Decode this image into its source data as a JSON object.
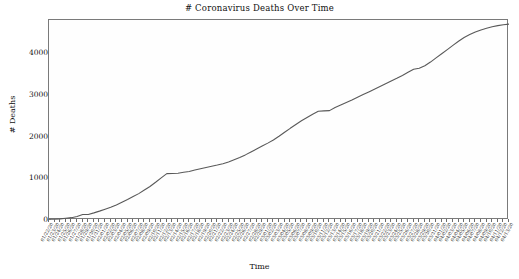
{
  "chart_data": {
    "type": "line",
    "title": "# Coronavirus Deaths Over Time",
    "xlabel": "Time",
    "ylabel": "# Deaths",
    "ylim": [
      0,
      4800
    ],
    "yticks": [
      0,
      1000,
      2000,
      3000,
      4000
    ],
    "ytick_labels": [
      "0",
      "1000",
      "2000",
      "3000",
      "4000"
    ],
    "grid": false,
    "legend": null,
    "line_color": "#595959",
    "frame_color": "#7a7a7a",
    "background": "#fefefe",
    "x": [
      "01/22/20",
      "01/23/20",
      "01/24/20",
      "01/25/20",
      "01/26/20",
      "01/27/20",
      "01/28/20",
      "01/29/20",
      "01/30/20",
      "01/31/20",
      "02/01/20",
      "02/02/20",
      "02/03/20",
      "02/04/20",
      "02/05/20",
      "02/06/20",
      "02/07/20",
      "02/08/20",
      "02/09/20",
      "02/10/20",
      "02/11/20",
      "02/12/20",
      "02/13/20",
      "02/14/20",
      "02/15/20",
      "02/16/20",
      "02/17/20",
      "02/18/20",
      "02/19/20",
      "02/20/20",
      "02/21/20",
      "02/22/20",
      "02/23/20",
      "02/24/20",
      "02/25/20",
      "02/26/20",
      "02/27/20",
      "02/28/20",
      "02/29/20",
      "03/01/20",
      "03/02/20",
      "03/03/20",
      "03/04/20",
      "03/05/20",
      "03/06/20",
      "03/07/20",
      "03/08/20",
      "03/09/20",
      "03/10/20",
      "03/11/20",
      "03/12/20",
      "03/13/20",
      "03/14/20",
      "03/15/20",
      "03/16/20",
      "03/17/20",
      "03/18/20",
      "03/19/20",
      "03/20/20",
      "03/21/20",
      "03/22/20",
      "03/23/20",
      "03/24/20",
      "03/25/20",
      "03/26/20",
      "03/27/20",
      "03/28/20",
      "03/29/20",
      "03/30/20",
      "03/31/20",
      "04/01/20",
      "04/02/20",
      "04/03/20",
      "04/04/20",
      "04/05/20",
      "04/06/20",
      "04/07/20",
      "04/08/20",
      "04/09/20",
      "04/10/20",
      "04/11/20",
      "04/12/20",
      "04/13/20"
    ],
    "values": [
      17,
      18,
      26,
      42,
      56,
      82,
      131,
      133,
      171,
      213,
      259,
      304,
      361,
      425,
      491,
      563,
      633,
      718,
      805,
      905,
      1012,
      1112,
      1117,
      1123,
      1145,
      1164,
      1198,
      1230,
      1261,
      1290,
      1318,
      1350,
      1390,
      1444,
      1500,
      1563,
      1632,
      1702,
      1774,
      1845,
      1920,
      2010,
      2105,
      2200,
      2290,
      2380,
      2460,
      2540,
      2610,
      2620,
      2625,
      2700,
      2760,
      2820,
      2880,
      2945,
      3010,
      3075,
      3140,
      3205,
      3270,
      3335,
      3400,
      3470,
      3545,
      3620,
      3640,
      3700,
      3790,
      3890,
      3990,
      4090,
      4190,
      4290,
      4380,
      4450,
      4510,
      4560,
      4600,
      4640,
      4665,
      4685,
      4700
    ]
  }
}
